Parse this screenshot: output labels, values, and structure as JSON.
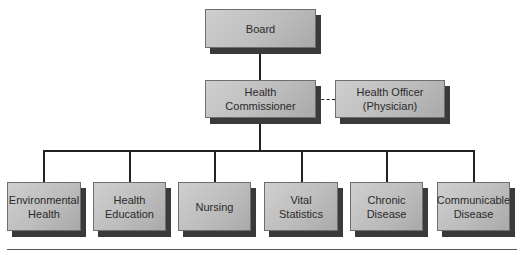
{
  "chart": {
    "type": "org-chart",
    "top": {
      "label": "Board"
    },
    "second": {
      "label": "Health\nCommissioner"
    },
    "advisor": {
      "label": "Health Officer\n(Physician)",
      "link": "dashed"
    },
    "departments": [
      {
        "label": "Environmental\nHealth"
      },
      {
        "label": "Health\nEducation"
      },
      {
        "label": "Nursing"
      },
      {
        "label": "Vital\nStatistics"
      },
      {
        "label": "Chronic\nDisease"
      },
      {
        "label": "Communicable\nDisease"
      }
    ]
  },
  "colors": {
    "box_fill": "#bdbdbd",
    "box_shadow": "#3a3a3a",
    "line": "#222222"
  }
}
